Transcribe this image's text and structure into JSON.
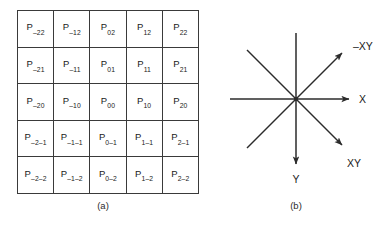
{
  "figure_a": {
    "caption": "(a)",
    "type": "grid-table",
    "rows": [
      [
        {
          "base": "P",
          "sub": "–22"
        },
        {
          "base": "P",
          "sub": "–12"
        },
        {
          "base": "P",
          "sub": "02"
        },
        {
          "base": "P",
          "sub": "12"
        },
        {
          "base": "P",
          "sub": "22"
        }
      ],
      [
        {
          "base": "P",
          "sub": "–21"
        },
        {
          "base": "P",
          "sub": "–11"
        },
        {
          "base": "P",
          "sub": "01"
        },
        {
          "base": "P",
          "sub": "11"
        },
        {
          "base": "P",
          "sub": "21"
        }
      ],
      [
        {
          "base": "P",
          "sub": "–20"
        },
        {
          "base": "P",
          "sub": "–10"
        },
        {
          "base": "P",
          "sub": "00"
        },
        {
          "base": "P",
          "sub": "10"
        },
        {
          "base": "P",
          "sub": "20"
        }
      ],
      [
        {
          "base": "P",
          "sub": "–2–1"
        },
        {
          "base": "P",
          "sub": "–1–1"
        },
        {
          "base": "P",
          "sub": "0–1"
        },
        {
          "base": "P",
          "sub": "1–1"
        },
        {
          "base": "P",
          "sub": "2–1"
        }
      ],
      [
        {
          "base": "P",
          "sub": "–2–2"
        },
        {
          "base": "P",
          "sub": "–1–2"
        },
        {
          "base": "P",
          "sub": "0–2"
        },
        {
          "base": "P",
          "sub": "1–2"
        },
        {
          "base": "P",
          "sub": "2–2"
        }
      ]
    ]
  },
  "figure_b": {
    "caption": "(b)",
    "type": "axis-star",
    "labels": {
      "up_right": "–XY",
      "right": "X",
      "down_right": "XY",
      "down": "Y"
    },
    "stroke_color": "#2b2b2b"
  }
}
